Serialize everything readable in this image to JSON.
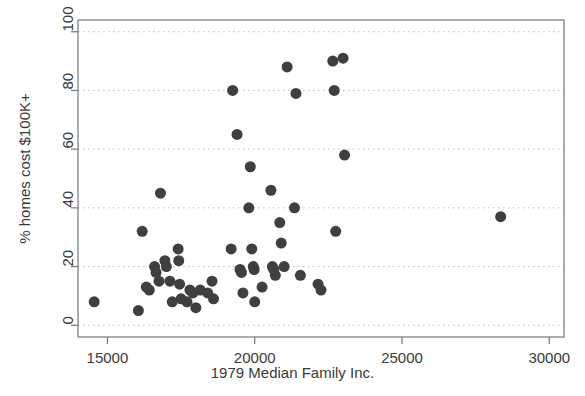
{
  "chart_data": {
    "type": "scatter",
    "title": "",
    "xlabel": "1979 Median Family Inc.",
    "ylabel": "% homes cost $100K+",
    "xlim": [
      14000,
      30500
    ],
    "ylim": [
      -4,
      104
    ],
    "xticks": [
      15000,
      20000,
      25000,
      30000
    ],
    "xticklabels": [
      "15000",
      "20000",
      "25000",
      "30000"
    ],
    "yticks": [
      0,
      20,
      40,
      60,
      80,
      100
    ],
    "yticklabels": [
      "0",
      "20",
      "40",
      "60",
      "80",
      "100"
    ],
    "grid": "horizontal-dotted",
    "legend": "none",
    "marker": {
      "shape": "circle",
      "color": "#3f3f3f",
      "size_px": 11
    },
    "frame_color": "#777777",
    "points": [
      {
        "x": 14550,
        "y": 8
      },
      {
        "x": 16050,
        "y": 5
      },
      {
        "x": 16180,
        "y": 32
      },
      {
        "x": 16320,
        "y": 13
      },
      {
        "x": 16420,
        "y": 12
      },
      {
        "x": 16600,
        "y": 20
      },
      {
        "x": 16650,
        "y": 18
      },
      {
        "x": 16750,
        "y": 15
      },
      {
        "x": 16800,
        "y": 45
      },
      {
        "x": 16950,
        "y": 22
      },
      {
        "x": 17000,
        "y": 20
      },
      {
        "x": 17120,
        "y": 15
      },
      {
        "x": 17200,
        "y": 8
      },
      {
        "x": 17400,
        "y": 26
      },
      {
        "x": 17420,
        "y": 22
      },
      {
        "x": 17450,
        "y": 14
      },
      {
        "x": 17500,
        "y": 9
      },
      {
        "x": 17700,
        "y": 8
      },
      {
        "x": 17800,
        "y": 12
      },
      {
        "x": 17900,
        "y": 11
      },
      {
        "x": 18000,
        "y": 6
      },
      {
        "x": 18150,
        "y": 12
      },
      {
        "x": 18400,
        "y": 11
      },
      {
        "x": 18550,
        "y": 15
      },
      {
        "x": 18600,
        "y": 9
      },
      {
        "x": 19200,
        "y": 26
      },
      {
        "x": 19250,
        "y": 80
      },
      {
        "x": 19400,
        "y": 65
      },
      {
        "x": 19500,
        "y": 19
      },
      {
        "x": 19550,
        "y": 18
      },
      {
        "x": 19600,
        "y": 11
      },
      {
        "x": 19800,
        "y": 40
      },
      {
        "x": 19850,
        "y": 54
      },
      {
        "x": 19900,
        "y": 26
      },
      {
        "x": 19950,
        "y": 20
      },
      {
        "x": 19980,
        "y": 19
      },
      {
        "x": 20000,
        "y": 8
      },
      {
        "x": 20250,
        "y": 13
      },
      {
        "x": 20550,
        "y": 46
      },
      {
        "x": 20600,
        "y": 20
      },
      {
        "x": 20650,
        "y": 19
      },
      {
        "x": 20700,
        "y": 17
      },
      {
        "x": 20850,
        "y": 35
      },
      {
        "x": 20900,
        "y": 28
      },
      {
        "x": 21000,
        "y": 20
      },
      {
        "x": 21100,
        "y": 88
      },
      {
        "x": 21350,
        "y": 40
      },
      {
        "x": 21400,
        "y": 79
      },
      {
        "x": 21550,
        "y": 17
      },
      {
        "x": 22150,
        "y": 14
      },
      {
        "x": 22250,
        "y": 12
      },
      {
        "x": 22650,
        "y": 90
      },
      {
        "x": 22700,
        "y": 80
      },
      {
        "x": 22750,
        "y": 32
      },
      {
        "x": 23000,
        "y": 91
      },
      {
        "x": 23050,
        "y": 58
      },
      {
        "x": 28350,
        "y": 37
      }
    ]
  }
}
